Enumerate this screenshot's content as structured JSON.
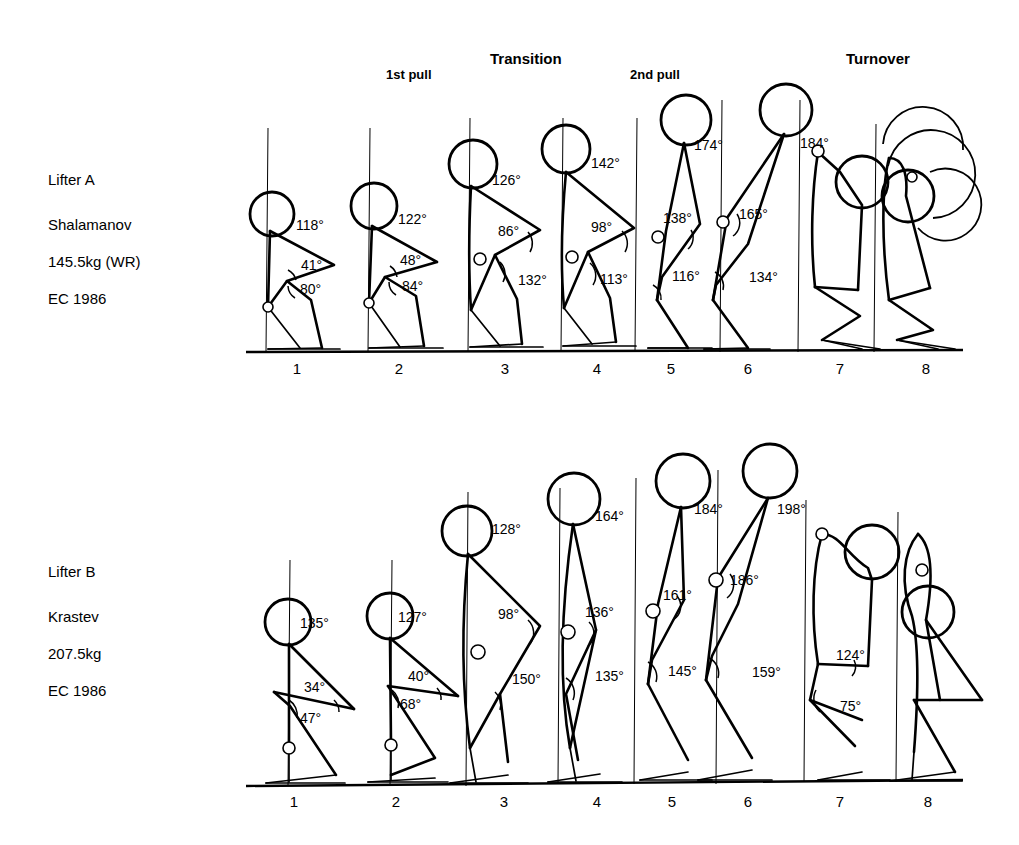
{
  "page": {
    "background": "#ffffff",
    "ink": "#000000"
  },
  "phases": [
    {
      "id": "first-pull",
      "label": "1st pull",
      "x": 386,
      "y": 67,
      "weight": "minor"
    },
    {
      "id": "transition",
      "label": "Transition",
      "x": 490,
      "y": 50,
      "weight": "major"
    },
    {
      "id": "second-pull",
      "label": "2nd pull",
      "x": 630,
      "y": 67,
      "weight": "minor"
    },
    {
      "id": "turnover",
      "label": "Turnover",
      "x": 846,
      "y": 50,
      "weight": "major"
    }
  ],
  "lifters": [
    {
      "id": "lifter-a",
      "label": "Lifter A",
      "name": "Shalamanov",
      "weight": "145.5kg (WR)",
      "event": "EC 1986",
      "block_x": 48,
      "block_y": 172,
      "baseline_y": 352,
      "numbers_y": 374,
      "frames": [
        {
          "n": "1",
          "x": 297
        },
        {
          "n": "2",
          "x": 399
        },
        {
          "n": "3",
          "x": 505
        },
        {
          "n": "4",
          "x": 597
        },
        {
          "n": "5",
          "x": 671
        },
        {
          "n": "6",
          "x": 748
        },
        {
          "n": "7",
          "x": 840
        },
        {
          "n": "8",
          "x": 926
        }
      ],
      "angles": [
        {
          "frame": 1,
          "value": "118°",
          "x": 296,
          "y": 230
        },
        {
          "frame": 1,
          "value": "41°",
          "x": 301,
          "y": 270
        },
        {
          "frame": 1,
          "value": "80°",
          "x": 300,
          "y": 294
        },
        {
          "frame": 2,
          "value": "122°",
          "x": 398,
          "y": 224
        },
        {
          "frame": 2,
          "value": "48°",
          "x": 400,
          "y": 265
        },
        {
          "frame": 2,
          "value": "84°",
          "x": 402,
          "y": 291
        },
        {
          "frame": 3,
          "value": "126°",
          "x": 492,
          "y": 185
        },
        {
          "frame": 3,
          "value": "86°",
          "x": 498,
          "y": 236
        },
        {
          "frame": 3,
          "value": "132°",
          "x": 518,
          "y": 285
        },
        {
          "frame": 4,
          "value": "142°",
          "x": 591,
          "y": 168
        },
        {
          "frame": 4,
          "value": "98°",
          "x": 591,
          "y": 232
        },
        {
          "frame": 4,
          "value": "113°",
          "x": 600,
          "y": 284
        },
        {
          "frame": 5,
          "value": "174°",
          "x": 694,
          "y": 150
        },
        {
          "frame": 5,
          "value": "138°",
          "x": 663,
          "y": 223
        },
        {
          "frame": 5,
          "value": "116°",
          "x": 672,
          "y": 281
        },
        {
          "frame": 6,
          "value": "184°",
          "x": 800,
          "y": 148
        },
        {
          "frame": 6,
          "value": "165°",
          "x": 739,
          "y": 219
        },
        {
          "frame": 6,
          "value": "134°",
          "x": 749,
          "y": 282
        }
      ]
    },
    {
      "id": "lifter-b",
      "label": "Lifter B",
      "name": "Krastev",
      "weight": "207.5kg",
      "event": "EC 1986",
      "block_x": 48,
      "block_y": 564,
      "baseline_y": 786,
      "numbers_y": 807,
      "frames": [
        {
          "n": "1",
          "x": 294
        },
        {
          "n": "2",
          "x": 396
        },
        {
          "n": "3",
          "x": 504
        },
        {
          "n": "4",
          "x": 597
        },
        {
          "n": "5",
          "x": 672
        },
        {
          "n": "6",
          "x": 748
        },
        {
          "n": "7",
          "x": 840
        },
        {
          "n": "8",
          "x": 928
        }
      ],
      "angles": [
        {
          "frame": 1,
          "value": "135°",
          "x": 300,
          "y": 628
        },
        {
          "frame": 1,
          "value": "34°",
          "x": 304,
          "y": 692
        },
        {
          "frame": 1,
          "value": "47°",
          "x": 300,
          "y": 723
        },
        {
          "frame": 2,
          "value": "127°",
          "x": 398,
          "y": 622
        },
        {
          "frame": 2,
          "value": "40°",
          "x": 408,
          "y": 681
        },
        {
          "frame": 2,
          "value": "68°",
          "x": 400,
          "y": 709
        },
        {
          "frame": 3,
          "value": "128°",
          "x": 492,
          "y": 534
        },
        {
          "frame": 3,
          "value": "98°",
          "x": 498,
          "y": 619
        },
        {
          "frame": 3,
          "value": "150°",
          "x": 512,
          "y": 684
        },
        {
          "frame": 4,
          "value": "164°",
          "x": 595,
          "y": 521
        },
        {
          "frame": 4,
          "value": "136°",
          "x": 585,
          "y": 617
        },
        {
          "frame": 4,
          "value": "135°",
          "x": 595,
          "y": 681
        },
        {
          "frame": 5,
          "value": "184°",
          "x": 694,
          "y": 514
        },
        {
          "frame": 5,
          "value": "161°",
          "x": 663,
          "y": 600
        },
        {
          "frame": 5,
          "value": "145°",
          "x": 668,
          "y": 676
        },
        {
          "frame": 6,
          "value": "198°",
          "x": 777,
          "y": 514
        },
        {
          "frame": 6,
          "value": "186°",
          "x": 730,
          "y": 585
        },
        {
          "frame": 6,
          "value": "159°",
          "x": 752,
          "y": 677
        },
        {
          "frame": 7,
          "value": "124°",
          "x": 836,
          "y": 660
        },
        {
          "frame": 7,
          "value": "75°",
          "x": 840,
          "y": 711
        }
      ]
    }
  ]
}
